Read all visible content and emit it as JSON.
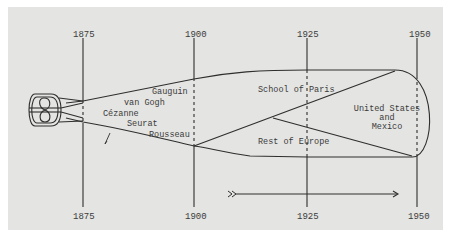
{
  "diagram": {
    "type": "timeline-flow",
    "years_top": [
      "1875",
      "1900",
      "1925",
      "1950"
    ],
    "years_bottom": [
      "1875",
      "1900",
      "1925",
      "1950"
    ],
    "artists": [
      "Gauguin",
      "van Gogh",
      "Cézanne",
      "Seurat",
      "Rousseau"
    ],
    "regions": {
      "upper": "School of Paris",
      "lower": "Rest of Europe",
      "right_line1": "United States",
      "right_line2": "and",
      "right_line3": "Mexico"
    },
    "arrow_marker": ">>",
    "colors": {
      "background": "#e4e4e2",
      "ink": "#2e2e2e"
    }
  }
}
